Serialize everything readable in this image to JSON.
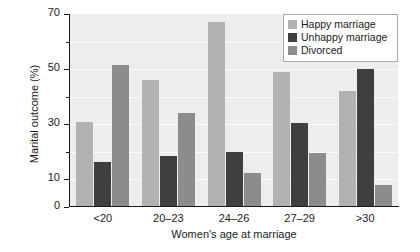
{
  "chart_data": {
    "type": "bar",
    "title": "",
    "xlabel": "Women's age at marriage",
    "ylabel": "Marital outcome (%)",
    "categories": [
      "<20",
      "20–23",
      "24–26",
      "27–29",
      ">30"
    ],
    "series": [
      {
        "name": "Happy marriage",
        "color": "#b2b2b2",
        "values": [
          31,
          46,
          67,
          49,
          42
        ]
      },
      {
        "name": "Unhappy marriage",
        "color": "#3f3f3f",
        "values": [
          16.5,
          18.5,
          20,
          30.5,
          50
        ]
      },
      {
        "name": "Divorced",
        "color": "#8c8c8c",
        "values": [
          51.5,
          34,
          12.5,
          19.5,
          8
        ]
      }
    ],
    "ylim": [
      0,
      70
    ],
    "ytick_values": [
      0,
      10,
      20,
      30,
      40,
      50,
      60,
      70
    ],
    "ytick_labels_major": [
      "0",
      "10",
      "30",
      "50",
      "70"
    ],
    "ytick_major_values": [
      0,
      10,
      30,
      50,
      70
    ],
    "ytick_minor_values": [
      20,
      40,
      60
    ],
    "grid": true,
    "gridline_values": [
      10,
      20,
      30,
      40,
      50,
      60
    ],
    "legend_position": "top-right",
    "plot_background": "#ededed",
    "gridline_color": "#fbfbfb",
    "axis_color": "#1a1a1a"
  }
}
